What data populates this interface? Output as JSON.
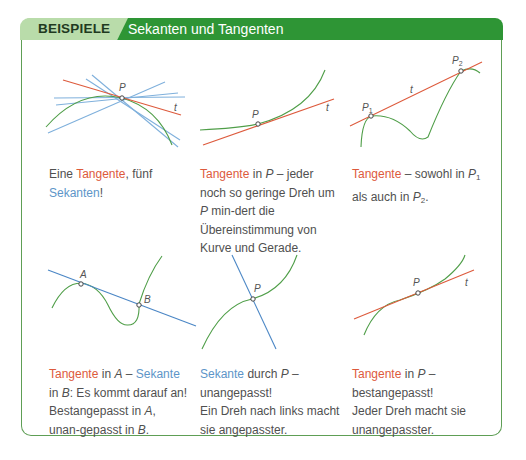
{
  "header": {
    "tab_label": "BEISPIELE",
    "title": "Sekanten und Tangenten"
  },
  "colors": {
    "tab_bg": "#b9dcaa",
    "bar_bg": "#2e9535",
    "border": "#5e9e55",
    "tangent": "#dd5a3c",
    "secant": "#5d95c8",
    "curve": "#4f9e48"
  },
  "examples": [
    {
      "labels": {
        "P": "P",
        "t": "t"
      },
      "caption": {
        "pre": "Eine ",
        "tangent": "Tangente",
        "mid": ", fünf",
        "secant": "Sekanten",
        "post": "!"
      }
    },
    {
      "labels": {
        "P": "P",
        "t": "t"
      },
      "caption": {
        "tangent": "Tangente",
        "a": " in ",
        "P": "P",
        "rest": " – jeder noch so geringe Dreh um ",
        "P2": "P",
        "rest2": " min-dert die Übereinstimmung von Kurve und Gerade."
      }
    },
    {
      "labels": {
        "P1": "P",
        "P1_sub": "1",
        "P2": "P",
        "P2_sub": "2",
        "t": "t"
      },
      "caption": {
        "tangent": "Tangente",
        "a": " – sowohl in ",
        "P": "P",
        "sub1": "1",
        "b": " als auch in ",
        "P2": "P",
        "sub2": "2",
        "c": "."
      }
    },
    {
      "labels": {
        "A": "A",
        "B": "B"
      },
      "caption": {
        "tangent": "Tangente",
        "a": " in ",
        "A": "A",
        "b": " – ",
        "secant": "Sekante",
        "c": " in ",
        "B": "B",
        "d": ": Es kommt darauf an! Bestangepasst in ",
        "A2": "A",
        "e": ", unan-gepasst in ",
        "B2": "B",
        "f": "."
      }
    },
    {
      "labels": {
        "P": "P"
      },
      "caption": {
        "secant": "Sekante",
        "a": " durch ",
        "P": "P",
        "b": " –",
        "line2": "unangepasst!",
        "line3": "Ein Dreh nach links macht sie angepasster."
      }
    },
    {
      "labels": {
        "P": "P",
        "t": "t"
      },
      "caption": {
        "tangent": "Tangente",
        "a": " in ",
        "P": "P",
        "b": " –",
        "line2": "bestangepasst!",
        "line3": "Jeder Dreh macht sie unangepasster."
      }
    }
  ]
}
